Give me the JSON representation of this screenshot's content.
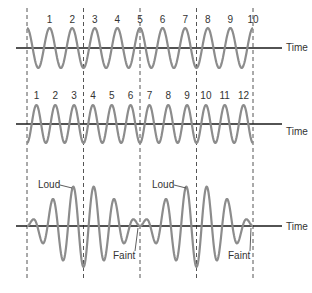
{
  "diagram": {
    "axis_label": "Time",
    "colors": {
      "wave": "#8c8c8c",
      "axis": "#1a1a1a",
      "dashed_line": "#555555",
      "text": "#333333"
    },
    "dashed_line_x": [
      27,
      83.5,
      140,
      196.5,
      253
    ],
    "panels": [
      {
        "id": "wave-a",
        "axis_y": 48,
        "amplitude": 20,
        "cycles": 10,
        "phase": "peak-start",
        "cycle_labels": [
          "1",
          "2",
          "3",
          "4",
          "5",
          "6",
          "7",
          "8",
          "9",
          "10"
        ],
        "label_y": 15,
        "time_label": "Time"
      },
      {
        "id": "wave-b",
        "axis_y": 124,
        "amplitude": 19,
        "cycles": 12,
        "phase": "trough-start",
        "cycle_labels": [
          "1",
          "2",
          "3",
          "4",
          "5",
          "6",
          "7",
          "8",
          "9",
          "10",
          "11",
          "12"
        ],
        "label_y": 91,
        "time_label": "Time"
      },
      {
        "id": "wave-sum",
        "axis_y": 226,
        "amplitude": 41,
        "cycles": 11,
        "phase": "beat",
        "time_label": "Time",
        "annotations": [
          {
            "text": "Loud",
            "x": 38,
            "y": 184,
            "target_x": 72,
            "target_y": 188
          },
          {
            "text": "Faint",
            "x": 113,
            "y": 251,
            "target_x": 138,
            "target_y": 228
          },
          {
            "text": "Loud",
            "x": 152,
            "y": 184,
            "target_x": 186,
            "target_y": 188
          },
          {
            "text": "Faint",
            "x": 228,
            "y": 251,
            "target_x": 251,
            "target_y": 228
          }
        ]
      }
    ]
  }
}
